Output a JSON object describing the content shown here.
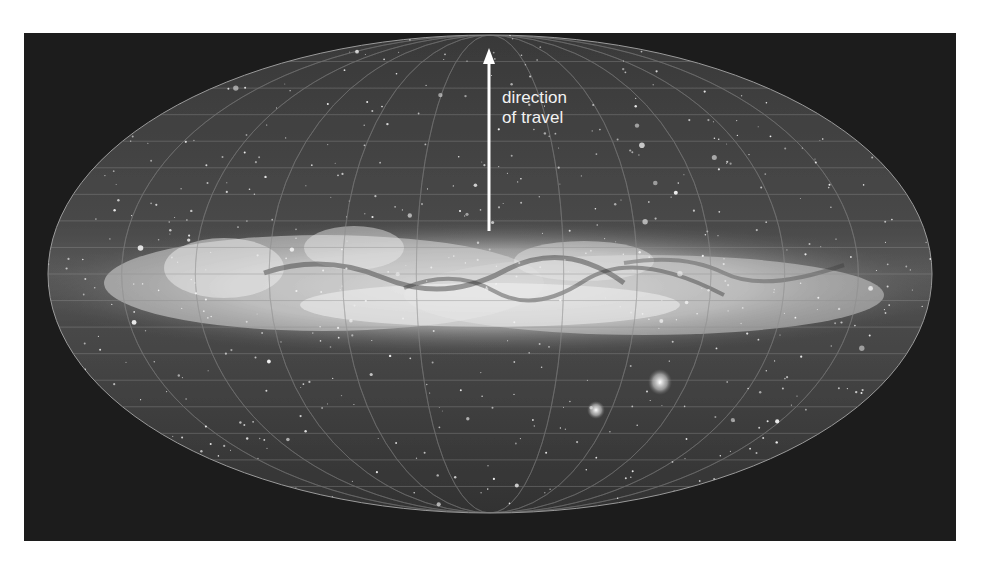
{
  "figure": {
    "annotation": {
      "line1": "direction",
      "line2": "of travel"
    },
    "arrow": {
      "direction": "up",
      "color": "#ffffff"
    },
    "colors": {
      "page_background": "#ffffff",
      "panel_background": "#1c1c1c",
      "grid_lines": "#8a8a8a",
      "milky_way": "#e6e6e6",
      "label_text": "#f2f2f2"
    },
    "features": [
      "Milky Way band",
      "Large Magellanic Cloud",
      "Small Magellanic Cloud",
      "coordinate grid"
    ]
  }
}
